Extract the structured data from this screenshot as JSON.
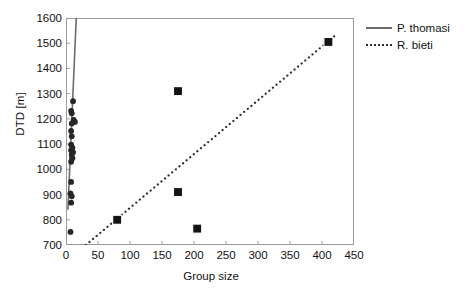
{
  "chart_data": {
    "type": "scatter",
    "title": "",
    "xlabel": "Group size",
    "ylabel": "DTD [m]",
    "xlim": [
      0,
      450
    ],
    "ylim": [
      700,
      1600
    ],
    "xticks": [
      0,
      50,
      100,
      150,
      200,
      250,
      300,
      350,
      400,
      450
    ],
    "yticks": [
      700,
      800,
      900,
      1000,
      1100,
      1200,
      1300,
      1400,
      1500,
      1600
    ],
    "grid": false,
    "legend_position": "top-right",
    "series": [
      {
        "name": "P. thomasi",
        "marker": "circle",
        "marker_color": "#262626",
        "line_style": "solid",
        "line_color": "#6b6b6b",
        "points": [
          {
            "x": 11,
            "y": 1270
          },
          {
            "x": 8,
            "y": 1232
          },
          {
            "x": 9,
            "y": 1222
          },
          {
            "x": 12,
            "y": 1196
          },
          {
            "x": 14,
            "y": 1188
          },
          {
            "x": 9,
            "y": 1182
          },
          {
            "x": 8,
            "y": 1152
          },
          {
            "x": 9,
            "y": 1131
          },
          {
            "x": 8,
            "y": 1098
          },
          {
            "x": 10,
            "y": 1086
          },
          {
            "x": 8,
            "y": 1076
          },
          {
            "x": 11,
            "y": 1068
          },
          {
            "x": 9,
            "y": 1058
          },
          {
            "x": 10,
            "y": 1044
          },
          {
            "x": 8,
            "y": 1030
          },
          {
            "x": 8,
            "y": 950
          },
          {
            "x": 7,
            "y": 905
          },
          {
            "x": 9,
            "y": 893
          },
          {
            "x": 8,
            "y": 868
          },
          {
            "x": 7,
            "y": 752
          }
        ],
        "fit_line": {
          "x_start": 3,
          "y_start": 840,
          "x_end": 16,
          "y_end": 1600
        }
      },
      {
        "name": "R. bieti",
        "marker": "square",
        "marker_color": "#141414",
        "line_style": "dotted",
        "line_color": "#2b2b2b",
        "points": [
          {
            "x": 80,
            "y": 800
          },
          {
            "x": 175,
            "y": 1310
          },
          {
            "x": 175,
            "y": 910
          },
          {
            "x": 205,
            "y": 765
          },
          {
            "x": 410,
            "y": 1505
          }
        ],
        "fit_line": {
          "x_start": 31,
          "y_start": 700,
          "x_end": 420,
          "y_end": 1530
        }
      }
    ]
  },
  "legend": {
    "items": [
      {
        "label": "P. thomasi",
        "style": "solid"
      },
      {
        "label": "R. bieti",
        "style": "dotted"
      }
    ]
  },
  "axes": {
    "y_title": "DTD [m]",
    "x_title": "Group size",
    "y_tick_labels": [
      "1600",
      "1500",
      "1400",
      "1300",
      "1200",
      "1100",
      "1000",
      "900",
      "800",
      "700"
    ],
    "x_tick_labels": [
      "0",
      "50",
      "100",
      "150",
      "200",
      "250",
      "300",
      "350",
      "400",
      "450"
    ]
  },
  "colors": {
    "axis": "#9b9b9b",
    "text": "#111111",
    "series_solid": "#6b6b6b",
    "series_dotted": "#2b2b2b",
    "marker_circle": "#262626",
    "marker_square": "#141414"
  }
}
